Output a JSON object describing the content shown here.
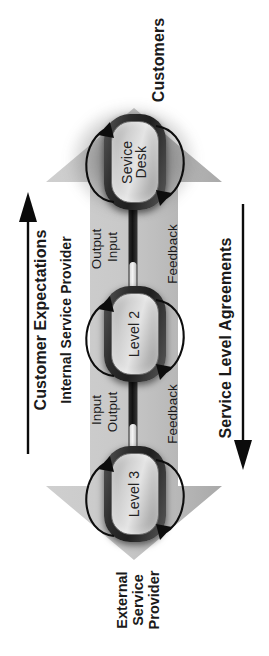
{
  "diagram": {
    "orientation": "rotated-90-ccw",
    "colors": {
      "background": "#ffffff",
      "arrow_gray": "#c9c9c9",
      "arrow_gray_dark": "#b0b0b0",
      "node_border_dark": "#262626",
      "node_fill_gray": "#cfcfcf",
      "text_black": "#1a1a1a"
    },
    "top_label": "Customers",
    "bottom_label_lines": [
      "External",
      "Service",
      "Provider"
    ],
    "left_axis": {
      "label": "Customer Expectations",
      "arrow_direction": "up"
    },
    "right_axis": {
      "label": "Service Level Agreements",
      "arrow_direction": "down"
    },
    "band_label": "Internal Service Provider",
    "nodes": [
      {
        "id": "service-desk",
        "label_line1": "Sevice",
        "label_line2": "Desk"
      },
      {
        "id": "level-2",
        "label": "Level 2"
      },
      {
        "id": "level-3",
        "label": "Level 3"
      }
    ],
    "flow_labels": [
      {
        "id": "io-upper-outer",
        "text": "Output"
      },
      {
        "id": "io-upper-inner",
        "text": "Input"
      },
      {
        "id": "io-lower-outer",
        "text": "Input"
      },
      {
        "id": "io-lower-inner",
        "text": "Output"
      }
    ],
    "feedback_labels": [
      {
        "id": "feedback-upper",
        "text": "Feedback"
      },
      {
        "id": "feedback-lower",
        "text": "Feedback"
      }
    ]
  }
}
